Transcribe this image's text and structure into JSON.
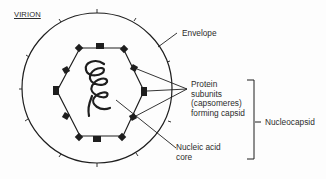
{
  "diagram": {
    "title": "VIRION",
    "labels": {
      "envelope": "Envelope",
      "protein_subunits": "Protein\nsubunits\n(capsomeres)\nforming capsid",
      "nucleic_acid_core": "Nucleic acid\ncore",
      "nucleocapsid": "Nucleocapsid"
    },
    "colors": {
      "line": "#1e1e1e",
      "background": "#fdfdfd"
    }
  }
}
